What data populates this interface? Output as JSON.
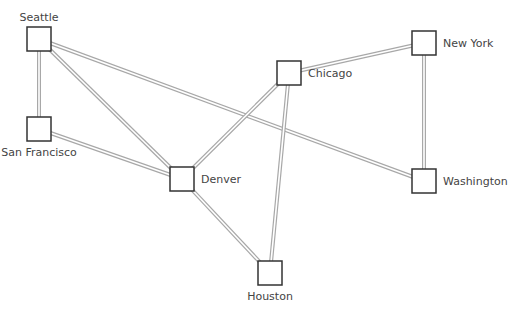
{
  "diagram": {
    "type": "network-graph",
    "colors": {
      "background": "#ffffff",
      "edge": "#a8a8a8",
      "node_border": "#333333",
      "label": "#444444"
    },
    "node_size": 24,
    "nodes": [
      {
        "id": "seattle",
        "label": "Seattle",
        "cx": 39,
        "cy": 39,
        "label_pos": "above"
      },
      {
        "id": "san-francisco",
        "label": "San Francisco",
        "cx": 39,
        "cy": 129,
        "label_pos": "below"
      },
      {
        "id": "denver",
        "label": "Denver",
        "cx": 182,
        "cy": 179,
        "label_pos": "right"
      },
      {
        "id": "chicago",
        "label": "Chicago",
        "cx": 289,
        "cy": 73,
        "label_pos": "right"
      },
      {
        "id": "new-york",
        "label": "New York",
        "cx": 424,
        "cy": 43,
        "label_pos": "right"
      },
      {
        "id": "washington",
        "label": "Washington",
        "cx": 424,
        "cy": 181,
        "label_pos": "right"
      },
      {
        "id": "houston",
        "label": "Houston",
        "cx": 270,
        "cy": 273,
        "label_pos": "below"
      }
    ],
    "edges": [
      {
        "from": "seattle",
        "to": "san-francisco"
      },
      {
        "from": "seattle",
        "to": "denver"
      },
      {
        "from": "seattle",
        "to": "washington"
      },
      {
        "from": "san-francisco",
        "to": "denver"
      },
      {
        "from": "denver",
        "to": "chicago"
      },
      {
        "from": "denver",
        "to": "houston"
      },
      {
        "from": "chicago",
        "to": "new-york"
      },
      {
        "from": "chicago",
        "to": "houston"
      },
      {
        "from": "new-york",
        "to": "washington"
      }
    ]
  }
}
